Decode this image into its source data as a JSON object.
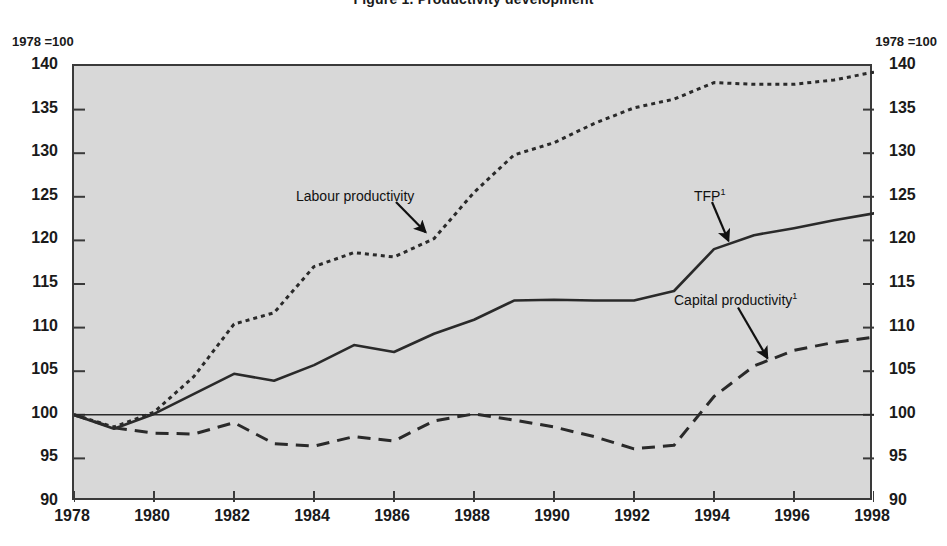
{
  "figure": {
    "title": "Figure 1. Productivity development",
    "unit_caption_left": "1978 =100",
    "unit_caption_right": "1978 =100"
  },
  "labels": {
    "labour": "Labour productivity",
    "tfp": "TFP",
    "tfp_footnote": "1",
    "capital": "Capital productivity",
    "capital_footnote": "1"
  },
  "chart_data": {
    "type": "line",
    "title": "Figure 1. Productivity development",
    "xlabel": "",
    "ylabel": "1978 =100",
    "xlim": [
      1978,
      1998
    ],
    "ylim": [
      90,
      140
    ],
    "yticks": [
      90,
      95,
      100,
      105,
      110,
      115,
      120,
      125,
      130,
      135,
      140
    ],
    "xticks": [
      1978,
      1980,
      1982,
      1984,
      1986,
      1988,
      1990,
      1992,
      1994,
      1996,
      1998
    ],
    "grid": false,
    "legend": "annotations-with-arrows",
    "reference_line": 100,
    "x": [
      1978,
      1979,
      1980,
      1981,
      1982,
      1983,
      1984,
      1985,
      1986,
      1987,
      1988,
      1989,
      1990,
      1991,
      1992,
      1993,
      1994,
      1995,
      1996,
      1997,
      1998
    ],
    "series": [
      {
        "name": "Labour productivity",
        "style": "dotted",
        "values": [
          100.0,
          98.6,
          100.3,
          104.4,
          110.4,
          111.7,
          117.0,
          118.6,
          118.1,
          120.2,
          125.5,
          129.8,
          131.2,
          133.4,
          135.2,
          136.2,
          138.1,
          137.9,
          137.9,
          138.4,
          139.3
        ]
      },
      {
        "name": "TFP",
        "style": "solid",
        "values": [
          100.0,
          98.4,
          100.1,
          102.4,
          104.7,
          103.9,
          105.7,
          108.0,
          107.2,
          109.3,
          110.9,
          113.1,
          113.2,
          113.1,
          113.1,
          114.2,
          119.0,
          120.6,
          121.4,
          122.3,
          123.1
        ]
      },
      {
        "name": "Capital productivity",
        "style": "dashed",
        "values": [
          100.0,
          98.5,
          97.9,
          97.8,
          99.1,
          96.7,
          96.4,
          97.5,
          97.0,
          99.3,
          100.1,
          99.4,
          98.6,
          97.5,
          96.1,
          96.5,
          102.1,
          105.6,
          107.4,
          108.3,
          108.9
        ]
      }
    ]
  }
}
